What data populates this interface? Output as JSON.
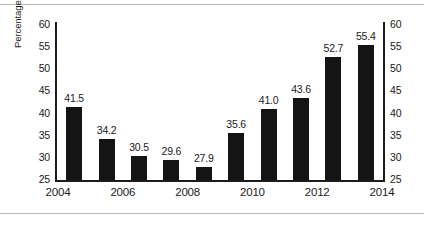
{
  "chart_data": {
    "type": "bar",
    "title": "",
    "subtitle": "",
    "xlabel": "",
    "ylabel": "Percentage of GDP",
    "ylim": [
      25,
      60
    ],
    "yticks": [
      25,
      30,
      35,
      40,
      45,
      50,
      55,
      60
    ],
    "ytick_labels": [
      "25",
      "30",
      "35",
      "40",
      "45",
      "50",
      "55",
      "60"
    ],
    "right_axis": true,
    "right_ytick_labels": [
      "25",
      "30",
      "35",
      "40",
      "45",
      "50",
      "55",
      "60"
    ],
    "grid": false,
    "legend": null,
    "x": [
      2005,
      2006,
      2007,
      2008,
      2009,
      2010,
      2011,
      2012,
      2013,
      2014
    ],
    "categories": [
      "2005",
      "2006",
      "2007",
      "2008",
      "2009",
      "2010",
      "2011",
      "2012",
      "2013",
      "2014"
    ],
    "values": [
      41.5,
      34.2,
      30.5,
      29.6,
      27.9,
      35.6,
      41.0,
      43.6,
      52.7,
      55.4
    ],
    "data_labels": [
      "41.5",
      "34.2",
      "30.5",
      "29.6",
      "27.9",
      "35.6",
      "41.0",
      "43.6",
      "52.7",
      "55.4"
    ],
    "xtick_labels": [
      "2004",
      "2006",
      "2008",
      "2010",
      "2012",
      "2014"
    ],
    "xtick_positions": [
      2004,
      2006,
      2008,
      2010,
      2012,
      2014
    ],
    "bar_color": "#141414",
    "axis_color": "#1a1a1a",
    "background": "#ffffff"
  }
}
